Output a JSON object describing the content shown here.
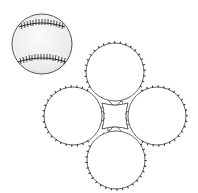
{
  "title": "Baseball cover pattern",
  "colors": {
    "background": "#ffffff",
    "outline": "#555555",
    "stitch": "#3a3a3a",
    "ball_fill": "#f2f2f2",
    "ball_shade": "#e2e2e2"
  },
  "baseball": {
    "label": "baseball",
    "cx": 42,
    "cy": 44,
    "r": 30
  },
  "pattern": {
    "label": "four-lobed cover pattern",
    "r": 29,
    "lobes": [
      {
        "name": "top",
        "cx": 115,
        "cy": 72
      },
      {
        "name": "left",
        "cx": 73,
        "cy": 116
      },
      {
        "name": "right",
        "cx": 157,
        "cy": 116
      },
      {
        "name": "bottom",
        "cx": 116,
        "cy": 160
      }
    ]
  }
}
